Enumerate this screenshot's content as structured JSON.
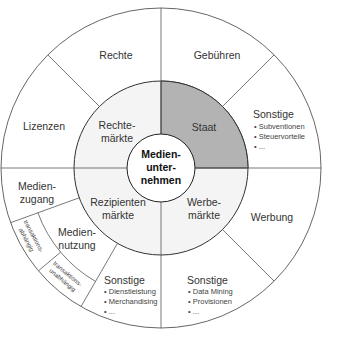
{
  "diagram": {
    "colors": {
      "background": "#ffffff",
      "middle_ring_fill": "#f4f4f4",
      "highlight_fill": "#b3b3b3",
      "line": "#444444",
      "text": "#333333"
    },
    "geometry": {
      "cx": 161,
      "cy": 168,
      "r_inner": 34,
      "r_middle": 87,
      "r_outer": 160,
      "r_subring": 131
    },
    "center": {
      "lines": [
        "Medien-",
        "unter-",
        "nehmen"
      ]
    },
    "markets": [
      {
        "id": "rechtemaerkte",
        "lines": [
          "Rechte-",
          "märkte"
        ],
        "highlighted": false
      },
      {
        "id": "staat",
        "lines": [
          "Staat"
        ],
        "highlighted": true
      },
      {
        "id": "werbemaerkte",
        "lines": [
          "Werbe-",
          "märkte"
        ],
        "highlighted": false
      },
      {
        "id": "rezipientenmaerkte",
        "lines": [
          "Rezipienten",
          "märkte"
        ],
        "highlighted": false
      }
    ],
    "revenue_sources": [
      {
        "id": "rechte",
        "label": "Rechte"
      },
      {
        "id": "lizenzen",
        "label": "Lizenzen"
      },
      {
        "id": "gebuehren",
        "label": "Gebühren"
      },
      {
        "id": "sonstige_staat",
        "label": "Sonstige",
        "bullets": [
          "Subventionen",
          "Steuervorteile",
          "..."
        ]
      },
      {
        "id": "werbung",
        "label": "Werbung"
      },
      {
        "id": "sonstige_werbung",
        "label": "Sonstige",
        "bullets": [
          "Data Mining",
          "Provisionen",
          "..."
        ]
      },
      {
        "id": "sonstige_rezipienten",
        "label": "Sonstige",
        "bullets": [
          "Dienstleistung",
          "Merchandising",
          "..."
        ]
      },
      {
        "id": "medienzugang",
        "lines": [
          "Medien-",
          "zugang"
        ]
      },
      {
        "id": "mediennutzung",
        "lines": [
          "Medien-",
          "nutzung"
        ]
      },
      {
        "id": "transaktionsabhaengig",
        "lines": [
          "transaktions-",
          "abhängig"
        ]
      },
      {
        "id": "transaktionsunabhaengig",
        "lines": [
          "transaktions-",
          "unabhängig"
        ]
      }
    ]
  }
}
